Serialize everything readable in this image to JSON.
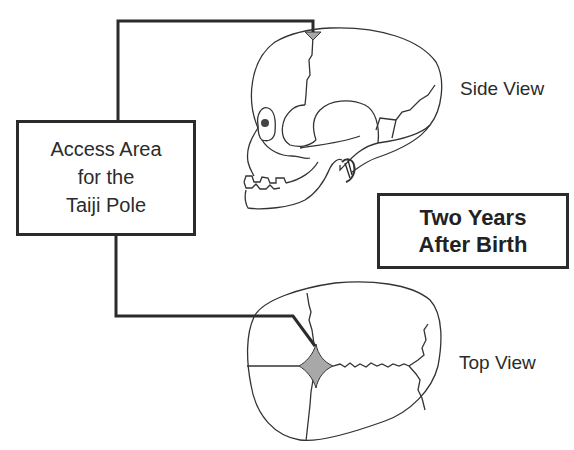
{
  "callout": {
    "lines": [
      "Access Area",
      "for the",
      "Taiji Pole"
    ]
  },
  "views": {
    "side_label": "Side View",
    "top_label": "Top View"
  },
  "age_box": {
    "lines": [
      "Two Years",
      "After Birth"
    ]
  },
  "colors": {
    "line": "#2b2b2b",
    "fontanelle_fill": "#a8a8a8",
    "background": "#ffffff"
  }
}
